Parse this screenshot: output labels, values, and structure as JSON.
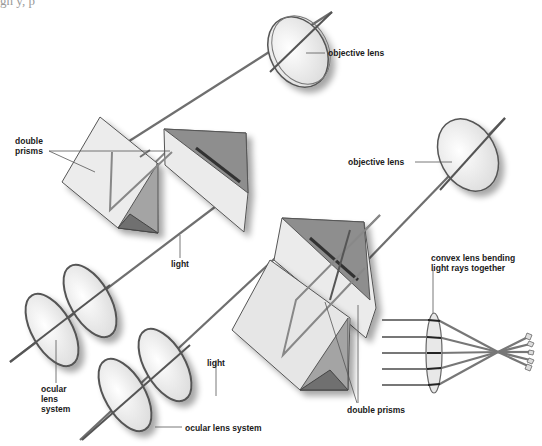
{
  "header": {
    "cropped_text_left": "gh   y,           p",
    "cropped_text_right": "       actually   their  larg"
  },
  "labels": {
    "objective_lens_top": "objective lens",
    "objective_lens_right": "objective lens",
    "double_prisms_left": "double\nprisms",
    "double_prisms_bottom": "double prisms",
    "light_top": "light",
    "light_bottom": "light",
    "ocular_lens_system_left": "ocular\nlens\nsystem",
    "ocular_lens_system_bottom": "ocular lens system",
    "convex_lens_caption": "convex lens bending\nlight rays together"
  },
  "colors": {
    "background": "#ffffff",
    "prism_light": "#ebebeb",
    "prism_mid": "#a6a6a6",
    "prism_dark": "#7a7a7a",
    "lens_fill": "#f2f2f2",
    "lens_rim": "#555555",
    "ray": "#7d7d7d",
    "label_text": "#1a1a1a"
  }
}
